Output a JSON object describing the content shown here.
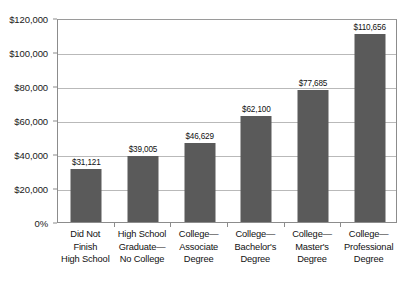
{
  "chart_data": {
    "type": "bar",
    "title": "",
    "xlabel": "",
    "ylabel": "",
    "grid": true,
    "legend": "none",
    "ylim": [
      0,
      120000
    ],
    "categories": [
      "Did Not Finish High School",
      "High School Graduate—No College",
      "College—Associate Degree",
      "College—Bachelor's Degree",
      "College—Master's Degree",
      "College—Professional Degree"
    ],
    "category_lines": [
      [
        "Did Not",
        "Finish",
        "High School"
      ],
      [
        "High School",
        "Graduate—",
        "No College"
      ],
      [
        "College—",
        "Associate",
        "Degree"
      ],
      [
        "College—",
        "Bachelor's",
        "Degree"
      ],
      [
        "College—",
        "Master's",
        "Degree"
      ],
      [
        "College—",
        "Professional",
        "Degree"
      ]
    ],
    "values": [
      31121,
      39005,
      46629,
      62100,
      77685,
      110656
    ],
    "value_labels": [
      "$31,121",
      "$39,005",
      "$46,629",
      "$62,100",
      "$77,685",
      "$110,656"
    ],
    "ytick_values": [
      120000,
      100000,
      80000,
      60000,
      40000,
      20000,
      0
    ],
    "ytick_labels": [
      "$120,000",
      "$100,000",
      "$80,000",
      "$60,000",
      "$40,000",
      "$20,000",
      "0%"
    ],
    "colors": {
      "bar": "#5a5a5a",
      "gridline": "#b9b9b9",
      "axis": "#8c8c8c",
      "text": "#111111",
      "background": "#ffffff"
    }
  }
}
